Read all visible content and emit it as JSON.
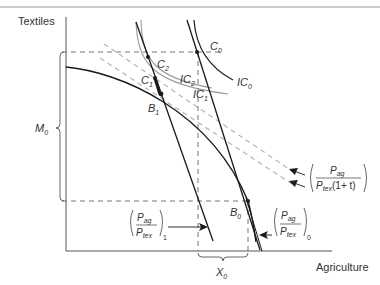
{
  "figure": {
    "type": "economics-trade-diagram",
    "axes": {
      "y_label": "Textiles",
      "x_label": "Agriculture"
    },
    "points": {
      "C0": "C",
      "C0_sub": "0",
      "C1": "C",
      "C1_sub": "1",
      "C2": "C",
      "C2_sub": "2",
      "B0": "B",
      "B0_sub": "0",
      "B1": "B",
      "B1_sub": "1"
    },
    "curves": {
      "IC0": "IC",
      "IC0_sub": "0",
      "IC1": "IC",
      "IC1_sub": "1",
      "IC2": "IC",
      "IC2_sub": "2"
    },
    "quantities": {
      "M0": "M",
      "M0_sub": "0",
      "X0": "X",
      "X0_sub": "0"
    },
    "price_labels": {
      "numerator": "P",
      "numerator_sub": "ag",
      "denominator": "P",
      "denominator_sub": "tex",
      "tariff_suffix": "(1+ t)",
      "subscript_1": "1",
      "subscript_0": "0"
    },
    "colors": {
      "line": "#1a1a1a",
      "gray_curve": "#9a9a9a",
      "dashed_gray": "#b5b5b5",
      "dashed_dark": "#555555",
      "text": "#333333"
    }
  }
}
